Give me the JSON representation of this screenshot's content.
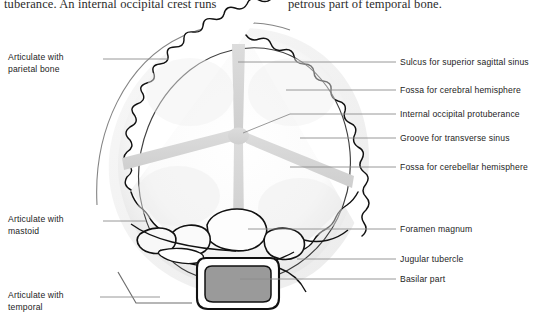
{
  "figure": {
    "body_text_left": "tuberance. An internal occipital crest runs",
    "body_text_right": "petrous part of temporal bone."
  },
  "labels_left": [
    {
      "id": "articulate-parietal",
      "line1": "Articulate with",
      "line2": "parietal bone",
      "text": "Articulate with parietal bone"
    },
    {
      "id": "articulate-mastoid",
      "line1": "Articulate with",
      "line2": "mastoid",
      "text": "Articulate with mastoid"
    },
    {
      "id": "articulate-temporal",
      "line1": "Articulate with",
      "line2": "temporal",
      "text": "Articulate with temporal"
    }
  ],
  "labels_right": [
    {
      "id": "sulcus-superior-sagittal-sinus",
      "text": "Sulcus for superior sagittal sinus"
    },
    {
      "id": "fossa-cerebral-hemisphere",
      "text": "Fossa for cerebral hemisphere"
    },
    {
      "id": "internal-occipital-protuberance",
      "text": "Internal occipital protuberance"
    },
    {
      "id": "groove-transverse-sinus",
      "text": "Groove for transverse sinus"
    },
    {
      "id": "fossa-cerebellar-hemisphere",
      "text": "Fossa for cerebellar hemisphere"
    },
    {
      "id": "foramen-magnum",
      "text": "Foramen magnum"
    },
    {
      "id": "jugular-tubercle",
      "text": "Jugular tubercle"
    },
    {
      "id": "basilar-part",
      "text": "Basilar part"
    }
  ],
  "colors": {
    "ink": "#1d1d1d",
    "outline": "#111111",
    "leader_line": "#8d8d8d",
    "bone_fill": "#ffffff",
    "shadow_fill": "#e8e8e8",
    "groove_fill": "#d6d6d6",
    "foramen_fill": "#9a9a9a",
    "page_background": "#ffffff"
  }
}
